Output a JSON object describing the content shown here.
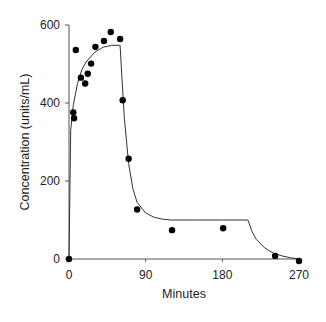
{
  "chart_data": {
    "type": "scatter",
    "title": "",
    "xlabel": "Minutes",
    "ylabel": "Concentration (units/mL)",
    "xlim": [
      0,
      270
    ],
    "ylim": [
      0,
      600
    ],
    "x_ticks": [
      0,
      90,
      180,
      270
    ],
    "y_ticks": [
      0,
      200,
      400,
      600
    ],
    "grid": false,
    "legend": null,
    "series": [
      {
        "name": "Observed",
        "kind": "scatter",
        "x": [
          0,
          5,
          6,
          8,
          14,
          19,
          22,
          26,
          31,
          41,
          49,
          60,
          63,
          70,
          80,
          121,
          181,
          242,
          270
        ],
        "y": [
          0,
          376,
          361,
          536,
          465,
          450,
          475,
          501,
          544,
          559,
          582,
          564,
          407,
          257,
          127,
          74,
          79,
          8,
          -5
        ]
      },
      {
        "name": "Model fit",
        "kind": "line",
        "x": [
          0,
          2,
          5,
          10,
          15,
          20,
          30,
          40,
          50,
          60,
          62,
          65,
          70,
          75,
          80,
          90,
          100,
          110,
          120,
          150,
          180,
          210,
          215,
          220,
          230,
          240,
          250,
          260,
          270
        ],
        "y": [
          0,
          330,
          395,
          450,
          485,
          505,
          530,
          543,
          548,
          548,
          470,
          360,
          245,
          180,
          145,
          118,
          107,
          102,
          100,
          100,
          100,
          100,
          70,
          50,
          28,
          15,
          8,
          3,
          0
        ]
      }
    ]
  }
}
